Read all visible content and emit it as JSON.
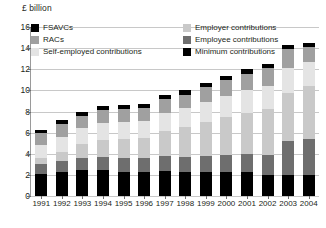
{
  "axis_unit_label": "£ billion",
  "legend": {
    "column_1": [
      {
        "label": "FSAVCs",
        "key": "fsavcs",
        "color": "#000000"
      },
      {
        "label": "RACs",
        "key": "racs",
        "color": "#a0a0a0"
      },
      {
        "label": "Self-employed contributions",
        "key": "self_employed",
        "color": "#e4e4e4"
      }
    ],
    "column_2": [
      {
        "label": "Employer contributions",
        "key": "employer",
        "color": "#c9c9c9"
      },
      {
        "label": "Employee contributions",
        "key": "employee",
        "color": "#6e6e6e"
      },
      {
        "label": "Minimum contributions",
        "key": "minimum",
        "color": "#000000"
      }
    ]
  },
  "chart_data": {
    "type": "bar",
    "subtype": "stacked",
    "title": "",
    "xlabel": "",
    "ylabel": "£ billion",
    "ylim": [
      0,
      16
    ],
    "yticks": [
      0,
      2,
      4,
      6,
      8,
      10,
      12,
      14,
      16
    ],
    "grid": true,
    "legend_position": "top",
    "categories": [
      "1991",
      "1992",
      "1993",
      "1994",
      "1995",
      "1996",
      "1997",
      "1998",
      "1999",
      "2000",
      "2001",
      "2002",
      "2003",
      "2004"
    ],
    "series": [
      {
        "name": "Minimum contributions",
        "key": "minimum",
        "color": "#000000",
        "values": [
          2.1,
          2.3,
          2.5,
          2.5,
          2.3,
          2.3,
          2.4,
          2.3,
          2.3,
          2.3,
          2.3,
          2.0,
          2.0,
          2.0
        ]
      },
      {
        "name": "Employee contributions",
        "key": "employee",
        "color": "#6e6e6e",
        "values": [
          0.9,
          1.0,
          1.1,
          1.2,
          1.3,
          1.3,
          1.4,
          1.4,
          1.5,
          1.6,
          1.7,
          1.9,
          3.2,
          3.4
        ]
      },
      {
        "name": "Employer contributions",
        "key": "employer",
        "color": "#c9c9c9",
        "values": [
          0.6,
          0.9,
          1.3,
          1.6,
          1.8,
          1.9,
          2.4,
          2.8,
          3.2,
          3.6,
          3.9,
          4.3,
          4.6,
          5.0
        ]
      },
      {
        "name": "Self-employed contributions",
        "key": "self_employed",
        "color": "#e4e4e4",
        "values": [
          1.2,
          1.4,
          1.5,
          1.6,
          1.6,
          1.6,
          1.7,
          1.8,
          1.9,
          2.0,
          2.1,
          2.2,
          2.3,
          2.3
        ]
      },
      {
        "name": "RACs",
        "key": "racs",
        "color": "#a0a0a0",
        "values": [
          1.2,
          1.2,
          1.2,
          1.2,
          1.2,
          1.2,
          1.3,
          1.3,
          1.4,
          1.5,
          1.6,
          1.7,
          1.8,
          1.4
        ]
      },
      {
        "name": "FSAVCs",
        "key": "fsavcs",
        "color": "#000000",
        "values": [
          0.3,
          0.4,
          0.4,
          0.4,
          0.4,
          0.4,
          0.4,
          0.4,
          0.4,
          0.4,
          0.4,
          0.4,
          0.4,
          0.4
        ]
      }
    ],
    "totals": [
      6.3,
      7.2,
      8.0,
      8.5,
      8.6,
      8.7,
      9.6,
      10.0,
      10.7,
      11.4,
      12.0,
      12.5,
      14.3,
      14.5
    ]
  }
}
